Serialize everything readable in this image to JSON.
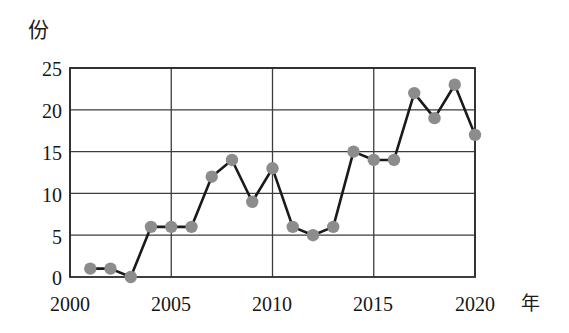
{
  "chart_data": {
    "type": "line",
    "title": "",
    "xlabel": "年",
    "ylabel": "份",
    "x": [
      2001,
      2002,
      2003,
      2004,
      2005,
      2006,
      2007,
      2008,
      2009,
      2010,
      2011,
      2012,
      2013,
      2014,
      2015,
      2016,
      2017,
      2018,
      2019,
      2020
    ],
    "values": [
      1,
      1,
      0,
      6,
      6,
      6,
      12,
      14,
      9,
      13,
      6,
      5,
      6,
      15,
      14,
      14,
      22,
      19,
      23,
      17
    ],
    "series": [
      {
        "name": "",
        "values": [
          1,
          1,
          0,
          6,
          6,
          6,
          12,
          14,
          9,
          13,
          6,
          5,
          6,
          15,
          14,
          14,
          22,
          19,
          23,
          17
        ]
      }
    ],
    "xlim": [
      2000,
      2020
    ],
    "ylim": [
      0,
      25
    ],
    "xticks": [
      2000,
      2005,
      2010,
      2015,
      2020
    ],
    "xtick_labels": [
      "2000",
      "2005",
      "2010",
      "2015",
      "2020"
    ],
    "yticks": [
      0,
      5,
      10,
      15,
      20,
      25
    ],
    "ytick_labels": [
      "0",
      "5",
      "10",
      "15",
      "20",
      "25"
    ],
    "grid": "both",
    "legend": "none",
    "marker": "circle",
    "marker_color": "#8c8c8c",
    "line_color": "#1a1a1a",
    "grid_color": "#3d3d3d",
    "axis_color": "#2b2b2b",
    "background": "#ffffff"
  }
}
